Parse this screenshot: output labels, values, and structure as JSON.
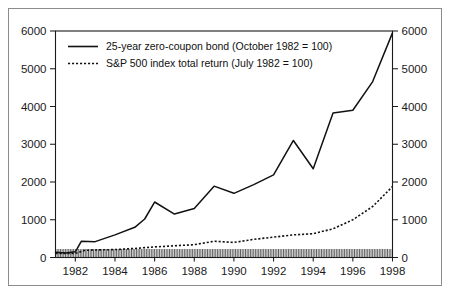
{
  "chart_data": {
    "type": "line",
    "title": "",
    "subtitle": "",
    "xlabel": "",
    "ylabel": "",
    "ylabel_right": "",
    "xlim": [
      1981.0,
      1998.0
    ],
    "ylim": [
      0,
      6000
    ],
    "grid": false,
    "legend_position": "top-left",
    "y_ticks": [
      0,
      1000,
      2000,
      3000,
      4000,
      5000,
      6000
    ],
    "y_tick_labels": [
      "0",
      "1000",
      "2000",
      "3000",
      "4000",
      "5000",
      "6000"
    ],
    "y_ticks_right": [
      0,
      1000,
      2000,
      3000,
      4000,
      5000,
      6000
    ],
    "y_tick_labels_right": [
      "0",
      "1000",
      "2000",
      "3000",
      "4000",
      "5000",
      "6000"
    ],
    "x_ticks": [
      1982,
      1984,
      1986,
      1988,
      1990,
      1992,
      1994,
      1996,
      1998
    ],
    "x_tick_labels": [
      "1982",
      "1984",
      "1986",
      "1988",
      "1990",
      "1992",
      "1994",
      "1996",
      "1998"
    ],
    "x_minor_ticks_note": "dense monthly tick marks along baseline",
    "series": [
      {
        "name": "25-year zero-coupon bond (October 1982 = 100)",
        "style": "solid",
        "color": "#111111",
        "x": [
          1981.0,
          1981.5,
          1982.0,
          1982.3,
          1983.0,
          1984.0,
          1985.0,
          1985.5,
          1986.0,
          1987.0,
          1988.0,
          1989.0,
          1990.0,
          1991.0,
          1992.0,
          1993.0,
          1994.0,
          1995.0,
          1996.0,
          1997.0,
          1998.0
        ],
        "values": [
          140,
          120,
          150,
          430,
          420,
          600,
          800,
          1020,
          1470,
          1150,
          1300,
          1890,
          1700,
          1930,
          2190,
          3100,
          2350,
          3830,
          3900,
          4660,
          5950
        ]
      },
      {
        "name": "S&P 500 index total return (July 1982 = 100)",
        "style": "dotted",
        "color": "#111111",
        "x": [
          1981.0,
          1982.0,
          1982.5,
          1983.0,
          1984.0,
          1985.0,
          1986.0,
          1987.0,
          1988.0,
          1989.0,
          1990.0,
          1991.0,
          1992.0,
          1993.0,
          1994.0,
          1995.0,
          1996.0,
          1997.0,
          1998.0
        ],
        "values": [
          110,
          110,
          190,
          200,
          210,
          240,
          280,
          310,
          340,
          430,
          400,
          480,
          540,
          600,
          630,
          760,
          1000,
          1350,
          1880
        ]
      }
    ]
  },
  "legend": {
    "entries": [
      {
        "label": "25-year zero-coupon bond (October 1982 = 100)",
        "style": "solid"
      },
      {
        "label": "S&P 500 index total return (July 1982 = 100)",
        "style": "dotted"
      }
    ]
  }
}
